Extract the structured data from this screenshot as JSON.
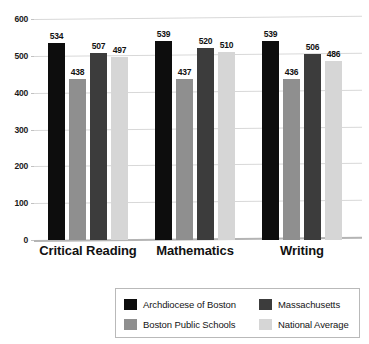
{
  "chart_data": {
    "type": "bar",
    "title": "",
    "xlabel": "",
    "ylabel": "",
    "ylim": [
      0,
      600
    ],
    "yticks": [
      0,
      100,
      200,
      300,
      400,
      500,
      600
    ],
    "grid": true,
    "legend_position": "bottom",
    "categories": [
      "Critical Reading",
      "Mathematics",
      "Writing"
    ],
    "series": [
      {
        "name": "Archdiocese of Boston",
        "color": "#0d0d0d",
        "values": [
          534,
          539,
          539
        ]
      },
      {
        "name": "Boston Public Schools",
        "color": "#8f8f8f",
        "values": [
          438,
          437,
          436
        ]
      },
      {
        "name": "Massachusetts",
        "color": "#3c3c3c",
        "values": [
          507,
          520,
          506
        ]
      },
      {
        "name": "National Average",
        "color": "#d6d6d6",
        "values": [
          497,
          510,
          486
        ]
      }
    ]
  },
  "axis": {
    "y_tick_labels": [
      "600",
      "500",
      "400",
      "300",
      "200",
      "100",
      "0"
    ]
  },
  "title_sliver": "",
  "legend": {
    "items": [
      {
        "label": "Archdiocese of Boston",
        "color": "#0d0d0d"
      },
      {
        "label": "Massachusetts",
        "color": "#3c3c3c"
      },
      {
        "label": "Boston Public Schools",
        "color": "#8f8f8f"
      },
      {
        "label": "National Average",
        "color": "#d6d6d6"
      }
    ]
  }
}
